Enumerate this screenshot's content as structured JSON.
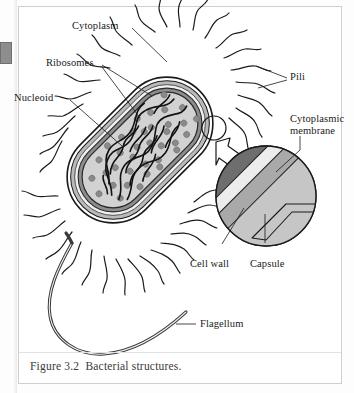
{
  "figure": {
    "caption": "Figure 3.2  Bacterial structures.",
    "page_tab": "4"
  },
  "labels": {
    "cytoplasm": "Cytoplasm",
    "ribosomes": "Ribosomes",
    "nucleoid": "Nucleoid",
    "pili": "Pili",
    "cytoplasmic_membrane_line1": "Cytoplasmic",
    "cytoplasmic_membrane_line2": "membrane",
    "cell_wall": "Cell wall",
    "capsule": "Capsule",
    "flagellum": "Flagellum"
  },
  "colors": {
    "ink": "#1a1a1a",
    "page": "#ffffff",
    "frame": "#cfcfcf",
    "cytoplasm_fill": "#d2d2d2",
    "membrane_dark": "#6e6e6e",
    "capsule_gray": "#a9a9a9",
    "cellwall_light": "#ececec",
    "ribosome_gray": "#8a8a8a",
    "nucleoid_black": "#111111",
    "inset_fill": "#cdcdcd",
    "arrow_fill": "#ffffff"
  },
  "diagram": {
    "type": "labeled-biological-diagram",
    "orientation": "rod-shaped cell tilted approximately 45 degrees",
    "structures": [
      "capsule",
      "cell wall",
      "cytoplasmic membrane",
      "cytoplasm",
      "nucleoid",
      "ribosomes",
      "pili",
      "flagellum"
    ],
    "inset": {
      "kind": "magnified circular detail",
      "shows": [
        "cytoplasmic membrane",
        "cell wall",
        "capsule"
      ]
    }
  }
}
